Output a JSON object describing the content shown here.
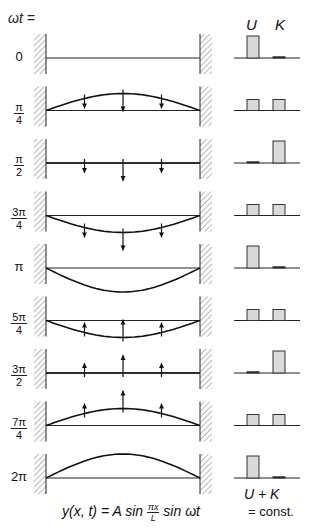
{
  "header": {
    "omega_label": "ωt =",
    "col_u": "U",
    "col_k": "K"
  },
  "colors": {
    "line": "#111111",
    "bar_fill": "#d9d9d9",
    "bar_stroke": "#333333",
    "hatch": "#888888"
  },
  "rows": [
    {
      "label_whole": "0",
      "num": "",
      "den": "",
      "phase": 0,
      "U": 1.0,
      "K": 0.0,
      "arrows": "none"
    },
    {
      "label_whole": "",
      "num": "π",
      "den": "4",
      "phase": 0.7071,
      "U": 0.5,
      "K": 0.5,
      "arrows": "down"
    },
    {
      "label_whole": "",
      "num": "π",
      "den": "2",
      "phase": 0,
      "U": 0.0,
      "K": 1.0,
      "arrows": "down"
    },
    {
      "label_whole": "",
      "num": "3π",
      "den": "4",
      "phase": -0.7071,
      "U": 0.5,
      "K": 0.5,
      "arrows": "down"
    },
    {
      "label_whole": "π",
      "num": "",
      "den": "",
      "phase": -1,
      "U": 1.0,
      "K": 0.0,
      "arrows": "none"
    },
    {
      "label_whole": "",
      "num": "5π",
      "den": "4",
      "phase": -0.7071,
      "U": 0.5,
      "K": 0.5,
      "arrows": "up"
    },
    {
      "label_whole": "",
      "num": "3π",
      "den": "2",
      "phase": 0,
      "U": 0.0,
      "K": 1.0,
      "arrows": "up"
    },
    {
      "label_whole": "",
      "num": "7π",
      "den": "4",
      "phase": 0.7071,
      "U": 0.5,
      "K": 0.5,
      "arrows": "up"
    },
    {
      "label_whole": "2π",
      "num": "",
      "den": "",
      "phase": 1,
      "U": 1.0,
      "K": 0.0,
      "arrows": "none"
    }
  ],
  "footer": {
    "eq_lhs": "y(x, t) = A  sin",
    "eq_frac_num": "πx",
    "eq_frac_den": "L",
    "eq_rhs": "sin ωt",
    "sum_label": "U + K",
    "const_label": "= const."
  }
}
